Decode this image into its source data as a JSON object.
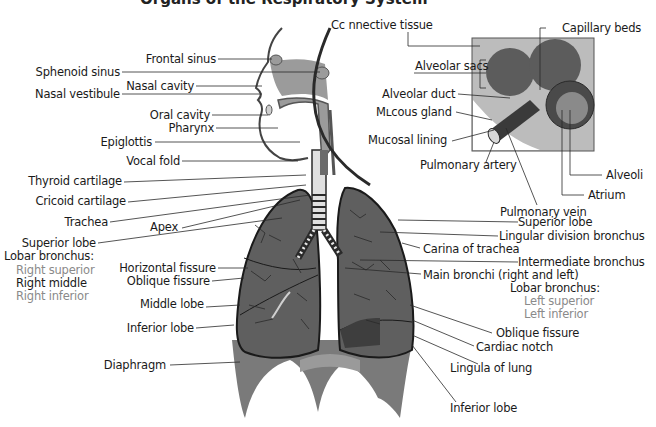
{
  "title": "Organs of the Respiratory System",
  "colors": {
    "tissue_grey": "#9b9b9b",
    "lung_dark": "#5f5f5f",
    "diaphragm": "#7a7a7a",
    "bronchi_dark": "#2a2a2a",
    "inset_bg": "#b5b5b5",
    "label_text": "#1a1a1a",
    "muted_label": "#8a8a8a"
  },
  "labels_left": {
    "frontal_sinus": "Frontal sinus",
    "sphenoid_sinus": "Sphenoid sinus",
    "nasal_cavity": "Nasal cavity",
    "nasal_vestibule": "Nasal vestibule",
    "oral_cavity": "Oral cavity",
    "pharynx": "Pharynx",
    "epiglottis": "Epiglottis",
    "vocal_fold": "Vocal fold",
    "thyroid_cartilage": "Thyroid cartilage",
    "cricoid_cartilage": "Cricoid cartilage",
    "trachea": "Trachea",
    "apex": "Apex",
    "superior_lobe": "Superior lobe",
    "lobar_bronchus": "Lobar bronchus:",
    "right_superior": "Right superior",
    "right_middle": "Right middle",
    "right_inferior": "Right inferior",
    "horizontal_fissure": "Horizontal fissure",
    "oblique_fissure": "Oblique fissure",
    "middle_lobe": "Middle lobe",
    "inferior_lobe": "Inferior lobe",
    "diaphragm": "Diaphragm"
  },
  "labels_inset": {
    "connective_tissue": "Cc nnective tissue",
    "capillary_beds": "Capillary beds",
    "alveolar_sacs": "Alveolar sacs",
    "alveolar_duct": "Alveolar duct",
    "mucous_gland": "Mʟcous gland",
    "mucosal_lining": "Mucosal lining",
    "pulmonary_artery": "Pulmonary artery",
    "alveoli": "Alveoli",
    "atrium": "Atrium",
    "pulmonary_vein": "Pulmonary vein"
  },
  "labels_right": {
    "superior_lobe": "Superior lobe",
    "lingular_division_bronchus": "Lingular division bronchus",
    "carina_of_trachea": "Carina of trachea",
    "intermediate_bronchus": "Intermediate bronchus",
    "main_bronchi": "Main bronchi (right and left)",
    "lobar_bronchus": "Lobar bronchus:",
    "left_superior": "Left superior",
    "left_inferior": "Left inferior",
    "oblique_fissure": "Oblique fissure",
    "cardiac_notch": "Cardiac notch",
    "lingula_of_lung": "Lingula of lung",
    "inferior_lobe": "Inferior lobe"
  }
}
